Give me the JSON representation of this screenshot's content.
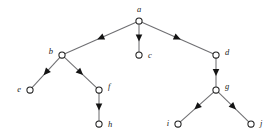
{
  "figure": {
    "kind": "rooted-tree-diagram",
    "width": 277,
    "height": 138,
    "background_color": "#ffffff",
    "node_fill_color": "#ffffff",
    "node_stroke_color": "#1d1d1d",
    "edge_color": "#6f6f72",
    "arrowhead_color": "#141414",
    "label_color": "#1a1a1a",
    "node_radius": 3.1,
    "arrow_position_fraction": 0.5
  },
  "nodes": [
    {
      "id": "a",
      "label": "a",
      "x": 139,
      "y": 21,
      "label_side": "top",
      "label_x": 139,
      "label_y": 12
    },
    {
      "id": "b",
      "label": "b",
      "x": 62,
      "y": 55,
      "label_side": "left",
      "label_x": 53,
      "label_y": 54
    },
    {
      "id": "c",
      "label": "c",
      "x": 139,
      "y": 55,
      "label_side": "right",
      "label_x": 148,
      "label_y": 58
    },
    {
      "id": "d",
      "label": "d",
      "x": 216,
      "y": 55,
      "label_side": "right",
      "label_x": 225,
      "label_y": 55
    },
    {
      "id": "e",
      "label": "e",
      "x": 30,
      "y": 90,
      "label_side": "left",
      "label_x": 21,
      "label_y": 92
    },
    {
      "id": "f",
      "label": "f",
      "x": 99,
      "y": 90,
      "label_side": "right",
      "label_x": 108,
      "label_y": 89
    },
    {
      "id": "g",
      "label": "g",
      "x": 216,
      "y": 90,
      "label_side": "right",
      "label_x": 225,
      "label_y": 89
    },
    {
      "id": "h",
      "label": "h",
      "x": 99,
      "y": 124,
      "label_side": "right",
      "label_x": 108,
      "label_y": 127
    },
    {
      "id": "i",
      "label": "i",
      "x": 178,
      "y": 124,
      "label_side": "left",
      "label_x": 169,
      "label_y": 126
    },
    {
      "id": "j",
      "label": "j",
      "x": 251,
      "y": 124,
      "label_side": "right",
      "label_x": 260,
      "label_y": 126
    }
  ],
  "edges": [
    {
      "id": "edge-a-b",
      "from": "a",
      "to": "b",
      "directed": true
    },
    {
      "id": "edge-a-c",
      "from": "a",
      "to": "c",
      "directed": true
    },
    {
      "id": "edge-a-d",
      "from": "a",
      "to": "d",
      "directed": true
    },
    {
      "id": "edge-b-e",
      "from": "b",
      "to": "e",
      "directed": true
    },
    {
      "id": "edge-b-f",
      "from": "b",
      "to": "f",
      "directed": true
    },
    {
      "id": "edge-d-g",
      "from": "d",
      "to": "g",
      "directed": true
    },
    {
      "id": "edge-f-h",
      "from": "f",
      "to": "h",
      "directed": true
    },
    {
      "id": "edge-g-i",
      "from": "g",
      "to": "i",
      "directed": true
    },
    {
      "id": "edge-g-j",
      "from": "g",
      "to": "j",
      "directed": true
    }
  ]
}
